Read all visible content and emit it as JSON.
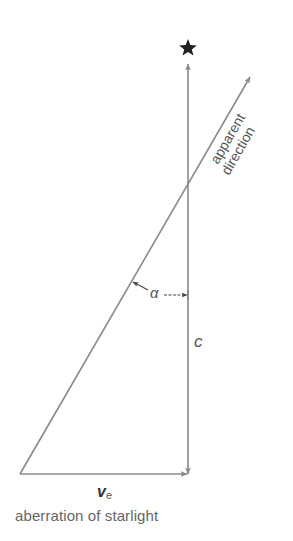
{
  "diagram": {
    "title": "aberration of starlight",
    "labels": {
      "star": "★",
      "apparent_line1": "apparent",
      "apparent_line2": "direction",
      "angle": "α",
      "light_speed": "c",
      "earth_velocity_main": "v",
      "earth_velocity_sub": "e"
    },
    "colors": {
      "line": "#8a8a8a",
      "text": "#555555",
      "star": "#222222"
    },
    "geometry": {
      "origin": [
        20,
        474
      ],
      "vertical_x": 188,
      "vertical_top": 64,
      "diagonal_tip": [
        250,
        77
      ],
      "star": [
        188,
        47
      ]
    }
  }
}
